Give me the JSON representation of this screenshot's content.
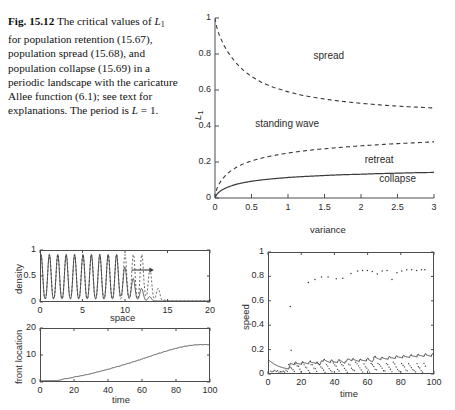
{
  "caption": {
    "fig_label": "Fig. 15.12",
    "line1_a": "The critical",
    "line2_a": "values of",
    "line2_sym": "L",
    "line2_subscript": "1",
    "line2_b": "for population",
    "line3": "retention (15.67), population",
    "line4": "spread (15.68), and",
    "line5": "population collapse (15.69) in",
    "line6": "a periodic landscape with the",
    "line7": "caricature Allee",
    "line8": "function (6.1); see text for",
    "line9": "explanations. The period is",
    "line10_sym": "L",
    "line10_rest": "= 1."
  },
  "colors": {
    "axis": "#4d4d4d",
    "curve": "#3a3a3a",
    "text": "#2b2b2b"
  },
  "chart_data": [
    {
      "id": "main",
      "type": "line",
      "title": "",
      "xlabel": "variance",
      "ylabel": "L_1",
      "ylabel_sym": "L",
      "ylabel_sub": "1",
      "xlim": [
        0,
        3
      ],
      "ylim": [
        0,
        1
      ],
      "xticks": [
        0,
        0.5,
        1,
        1.5,
        2,
        2.5,
        3
      ],
      "xticklabels": [
        "0",
        "0.5",
        "1",
        "1.5",
        "2",
        "2.5",
        "3"
      ],
      "yticks": [
        0,
        0.2,
        0.4,
        0.6,
        0.8,
        1
      ],
      "yticklabels": [
        "0",
        "0.2",
        "0.4",
        "0.6",
        "0.8",
        "1"
      ],
      "grid": false,
      "legend": "none",
      "annotations": [
        {
          "text": "spread",
          "x": 1.35,
          "y": 0.79
        },
        {
          "text": "standing wave",
          "x": 0.55,
          "y": 0.41
        },
        {
          "text": "retreat",
          "x": 2.05,
          "y": 0.21
        },
        {
          "text": "collapse",
          "x": 2.25,
          "y": 0.105
        }
      ],
      "series": [
        {
          "name": "population spread (15.68)",
          "style": "dashed",
          "x": [
            0.0,
            0.02,
            0.05,
            0.08,
            0.12,
            0.17,
            0.22,
            0.3,
            0.4,
            0.5,
            0.65,
            0.8,
            1.0,
            1.2,
            1.4,
            1.6,
            1.8,
            2.0,
            2.2,
            2.4,
            2.6,
            2.8,
            3.0
          ],
          "y": [
            1.0,
            0.955,
            0.915,
            0.885,
            0.85,
            0.815,
            0.785,
            0.745,
            0.705,
            0.675,
            0.64,
            0.615,
            0.59,
            0.57,
            0.556,
            0.544,
            0.534,
            0.526,
            0.519,
            0.513,
            0.508,
            0.504,
            0.5
          ]
        },
        {
          "name": "population retention (15.67)",
          "style": "dashed",
          "x": [
            0.0,
            0.02,
            0.05,
            0.1,
            0.16,
            0.22,
            0.3,
            0.4,
            0.5,
            0.65,
            0.8,
            1.0,
            1.2,
            1.4,
            1.6,
            1.8,
            2.0,
            2.2,
            2.4,
            2.6,
            2.8,
            3.0
          ],
          "y": [
            0.0,
            0.045,
            0.075,
            0.105,
            0.132,
            0.152,
            0.172,
            0.192,
            0.206,
            0.223,
            0.236,
            0.25,
            0.261,
            0.27,
            0.277,
            0.284,
            0.29,
            0.295,
            0.3,
            0.304,
            0.308,
            0.312
          ]
        },
        {
          "name": "population collapse (15.69)",
          "style": "solid",
          "x": [
            0.0,
            0.02,
            0.05,
            0.1,
            0.16,
            0.22,
            0.3,
            0.4,
            0.5,
            0.65,
            0.8,
            1.0,
            1.2,
            1.4,
            1.6,
            1.8,
            2.0,
            2.2,
            2.4,
            2.6,
            2.8,
            3.0
          ],
          "y": [
            0.0,
            0.018,
            0.031,
            0.046,
            0.058,
            0.067,
            0.077,
            0.086,
            0.093,
            0.101,
            0.107,
            0.114,
            0.119,
            0.123,
            0.127,
            0.13,
            0.132,
            0.135,
            0.137,
            0.139,
            0.141,
            0.142
          ]
        }
      ]
    },
    {
      "id": "density",
      "type": "line",
      "xlabel": "space",
      "ylabel": "density",
      "xlim": [
        0,
        20
      ],
      "ylim": [
        0,
        1
      ],
      "xticks": [
        0,
        5,
        10,
        15,
        20
      ],
      "xticklabels": [
        "0",
        "5",
        "10",
        "15",
        "20"
      ],
      "yticks": [
        0,
        0.5,
        1
      ],
      "yticklabels": [
        "0",
        "0.5",
        "1"
      ],
      "grid": false,
      "annotations": [
        {
          "text": "arrow-right",
          "x": 11.5,
          "y": 0.62
        }
      ],
      "series": [
        {
          "name": "density profile (solid)",
          "style": "solid",
          "period": 1.0,
          "peak": 0.93,
          "front_x": 9.0,
          "decay_to": 13.8
        },
        {
          "name": "density profile (dashed)",
          "style": "dashed",
          "period": 1.0,
          "peak": 0.93,
          "front_x": 12.3,
          "decay_to": 15.0
        }
      ]
    },
    {
      "id": "front_location",
      "type": "line",
      "xlabel": "time",
      "ylabel": "front location",
      "xlim": [
        0,
        100
      ],
      "ylim": [
        0,
        20
      ],
      "xticks": [
        0,
        20,
        40,
        60,
        80,
        100
      ],
      "xticklabels": [
        "0",
        "20",
        "40",
        "60",
        "80",
        "100"
      ],
      "yticks": [
        0,
        10,
        20
      ],
      "yticklabels": [
        "0",
        "10",
        "20"
      ],
      "grid": false,
      "series": [
        {
          "name": "front location staircase",
          "style": "solid",
          "x": [
            0,
            5,
            10,
            12,
            14,
            16,
            18,
            20,
            23,
            26,
            29,
            32,
            35,
            38,
            41,
            44,
            47,
            50,
            53,
            56,
            59,
            62,
            65,
            68,
            71,
            74,
            77,
            80,
            83,
            86,
            89,
            92,
            95
          ],
          "y": [
            0.1,
            0.12,
            0.15,
            0.5,
            0.9,
            1.0,
            1.2,
            1.6,
            1.9,
            2.3,
            2.7,
            3.2,
            3.7,
            4.2,
            4.7,
            5.3,
            5.8,
            6.4,
            7.0,
            7.6,
            8.2,
            8.9,
            9.5,
            10.2,
            10.8,
            11.4,
            12.0,
            12.5,
            13.0,
            13.4,
            13.7,
            13.9,
            14.0
          ]
        }
      ]
    },
    {
      "id": "speed",
      "type": "scatter",
      "xlabel": "time",
      "ylabel": "speed",
      "xlim": [
        0,
        100
      ],
      "ylim": [
        0,
        1
      ],
      "xticks": [
        0,
        20,
        40,
        60,
        80,
        100
      ],
      "xticklabels": [
        "0",
        "20",
        "40",
        "60",
        "80",
        "100"
      ],
      "yticks": [
        0,
        0.2,
        0.4,
        0.6,
        0.8,
        1
      ],
      "yticklabels": [
        "0",
        "0.2",
        "0.4",
        "0.6",
        "0.8",
        "1"
      ],
      "grid": false,
      "series": [
        {
          "name": "instantaneous speed (dots, upper cloud)",
          "style": "dots",
          "points": [
            [
              13,
              0.555
            ],
            [
              13.5,
              0.19
            ],
            [
              24,
              0.755
            ],
            [
              28,
              0.78
            ],
            [
              32,
              0.8
            ],
            [
              36,
              0.8
            ],
            [
              41,
              0.785
            ],
            [
              45,
              0.79
            ],
            [
              50,
              0.83
            ],
            [
              54,
              0.85
            ],
            [
              57,
              0.855
            ],
            [
              60,
              0.855
            ],
            [
              63,
              0.845
            ],
            [
              66,
              0.825
            ],
            [
              69,
              0.85
            ],
            [
              72,
              0.855
            ],
            [
              75,
              0.78
            ],
            [
              78,
              0.835
            ],
            [
              81,
              0.85
            ],
            [
              84,
              0.86
            ],
            [
              87,
              0.86
            ],
            [
              90,
              0.855
            ],
            [
              93,
              0.86
            ],
            [
              95,
              0.86
            ]
          ]
        },
        {
          "name": "mean speed (solid sawtooth)",
          "style": "solid",
          "x": [
            0,
            3,
            6,
            9,
            12,
            13,
            16,
            20,
            24,
            28,
            31,
            32,
            36,
            40,
            44,
            47,
            48,
            52,
            56,
            60,
            63,
            64,
            68,
            72,
            76,
            80,
            84,
            88,
            92,
            95
          ],
          "y": [
            0.105,
            0.075,
            0.055,
            0.042,
            0.034,
            0.085,
            0.082,
            0.086,
            0.09,
            0.094,
            0.073,
            0.112,
            0.102,
            0.098,
            0.105,
            0.09,
            0.122,
            0.112,
            0.108,
            0.115,
            0.104,
            0.132,
            0.124,
            0.127,
            0.133,
            0.138,
            0.141,
            0.146,
            0.15,
            0.152
          ]
        },
        {
          "name": "lower speed dots (sawtooth cloud)",
          "style": "dots-low",
          "note": "dense scatter between 0 and 0.09 forming repeating descending streaks"
        }
      ]
    }
  ]
}
